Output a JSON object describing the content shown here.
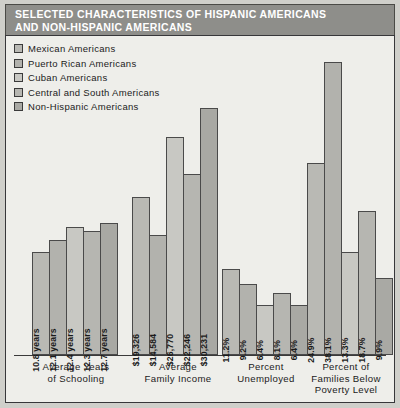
{
  "header": {
    "title": "SELECTED CHARACTERISTICS OF HISPANIC AMERICANS\nAND NON-HISPANIC AMERICANS"
  },
  "legend": {
    "items": [
      {
        "label": "Mexican Americans",
        "color": "#b9b9b4"
      },
      {
        "label": "Puerto Rican Americans",
        "color": "#b2b2ad"
      },
      {
        "label": "Cuban Americans",
        "color": "#c8c8c3"
      },
      {
        "label": "Central and South Americans",
        "color": "#b6b6b1"
      },
      {
        "label": "Non-Hispanic Americans",
        "color": "#a9a9a4"
      }
    ]
  },
  "chart_data": {
    "type": "bar",
    "title": "SELECTED CHARACTERISTICS OF HISPANIC AMERICANS AND NON-HISPANIC AMERICANS",
    "xlabel": "",
    "ylabel": "",
    "grid": false,
    "legend_position": "top-left",
    "categories": [
      "Average Years\nof Schooling",
      "Average\nFamily Income",
      "Percent\nUnemployed",
      "Percent of\nFamilies Below\nPoverty Level"
    ],
    "series": [
      {
        "name": "Mexican Americans",
        "values": [
          10.8,
          19326,
          11.2,
          24.9
        ],
        "labels": [
          "10.8 years",
          "$19,326",
          "11.2%",
          "24.9%"
        ]
      },
      {
        "name": "Puerto Rican Americans",
        "values": [
          12.1,
          14584,
          9.2,
          38.1
        ],
        "labels": [
          "12.1 years",
          "$14,584",
          "9.2%",
          "38.1%"
        ]
      },
      {
        "name": "Cuban Americans",
        "values": [
          12.4,
          26770,
          6.4,
          13.3
        ],
        "labels": [
          "12.4 years",
          "$26,770",
          "6.4%",
          "13.3%"
        ]
      },
      {
        "name": "Central and South Americans",
        "values": [
          12.3,
          22246,
          8.1,
          18.7
        ],
        "labels": [
          "12.3 years",
          "$22,246",
          "8.1%",
          "18.7%"
        ]
      },
      {
        "name": "Non-Hispanic Americans",
        "values": [
          12.7,
          30231,
          6.4,
          9.9
        ],
        "labels": [
          "12.7 years",
          "$30,231",
          "6.4%",
          "9.9%"
        ]
      }
    ]
  },
  "bars": {
    "g0": [
      {
        "label": "10.8 years",
        "h": 103
      },
      {
        "label": "12.1 years",
        "h": 115
      },
      {
        "label": "12.4 years",
        "h": 128
      },
      {
        "label": "12.3 years",
        "h": 124
      },
      {
        "label": "12.7 years",
        "h": 132
      }
    ],
    "g1": [
      {
        "label": "$19,326",
        "h": 158
      },
      {
        "label": "$14,584",
        "h": 120
      },
      {
        "label": "$26,770",
        "h": 218
      },
      {
        "label": "$22,246",
        "h": 181
      },
      {
        "label": "$30,231",
        "h": 247
      }
    ],
    "g2": [
      {
        "label": "11.2%",
        "h": 86
      },
      {
        "label": "9.2%",
        "h": 71
      },
      {
        "label": "6.4%",
        "h": 50
      },
      {
        "label": "8.1%",
        "h": 62
      },
      {
        "label": "6.4%",
        "h": 50
      }
    ],
    "g3": [
      {
        "label": "24.9%",
        "h": 192
      },
      {
        "label": "38.1%",
        "h": 293
      },
      {
        "label": "13.3%",
        "h": 103
      },
      {
        "label": "18.7%",
        "h": 144
      },
      {
        "label": "9.9%",
        "h": 77
      }
    ]
  }
}
